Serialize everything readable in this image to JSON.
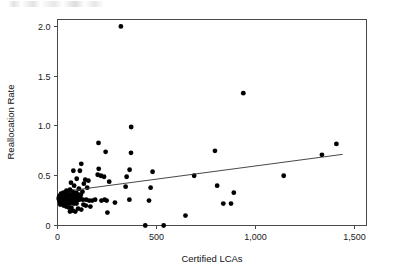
{
  "chart_data": {
    "type": "scatter",
    "title": "",
    "xlabel": "Certified LCAs",
    "ylabel": "Reallocation Rate",
    "xlim": [
      0,
      1560
    ],
    "ylim": [
      0,
      2.07
    ],
    "grid": false,
    "legend": null,
    "x_ticks": [
      0,
      500,
      1000,
      1500
    ],
    "x_tick_labels": [
      "0",
      "500",
      "1,000",
      "1,500"
    ],
    "y_ticks": [
      0,
      0.5,
      1.0,
      1.5,
      2.0
    ],
    "y_tick_labels": [
      "0",
      "0.5",
      "1.0",
      "1.5",
      "2.0"
    ],
    "marker": "filled-circle",
    "marker_color": "#000000",
    "points": [
      [
        320,
        2.0
      ],
      [
        938,
        1.33
      ],
      [
        372,
        0.99
      ],
      [
        207,
        0.83
      ],
      [
        1408,
        0.82
      ],
      [
        795,
        0.75
      ],
      [
        243,
        0.74
      ],
      [
        371,
        0.73
      ],
      [
        1335,
        0.71
      ],
      [
        120,
        0.62
      ],
      [
        208,
        0.57
      ],
      [
        364,
        0.56
      ],
      [
        480,
        0.54
      ],
      [
        80,
        0.55
      ],
      [
        113,
        0.55
      ],
      [
        203,
        0.51
      ],
      [
        219,
        0.5
      ],
      [
        235,
        0.49
      ],
      [
        349,
        0.49
      ],
      [
        690,
        0.5
      ],
      [
        1142,
        0.5
      ],
      [
        97,
        0.47
      ],
      [
        140,
        0.46
      ],
      [
        156,
        0.45
      ],
      [
        261,
        0.44
      ],
      [
        68,
        0.43
      ],
      [
        133,
        0.42
      ],
      [
        84,
        0.4
      ],
      [
        806,
        0.4
      ],
      [
        344,
        0.39
      ],
      [
        470,
        0.38
      ],
      [
        150,
        0.38
      ],
      [
        108,
        0.37
      ],
      [
        63,
        0.36
      ],
      [
        45,
        0.35
      ],
      [
        30,
        0.33
      ],
      [
        52,
        0.33
      ],
      [
        76,
        0.34
      ],
      [
        95,
        0.33
      ],
      [
        126,
        0.34
      ],
      [
        890,
        0.33
      ],
      [
        18,
        0.32
      ],
      [
        36,
        0.32
      ],
      [
        58,
        0.31
      ],
      [
        71,
        0.31
      ],
      [
        88,
        0.32
      ],
      [
        104,
        0.31
      ],
      [
        118,
        0.31
      ],
      [
        12,
        0.3
      ],
      [
        26,
        0.3
      ],
      [
        41,
        0.3
      ],
      [
        55,
        0.29
      ],
      [
        66,
        0.29
      ],
      [
        79,
        0.3
      ],
      [
        92,
        0.29
      ],
      [
        8,
        0.29
      ],
      [
        20,
        0.28
      ],
      [
        33,
        0.28
      ],
      [
        47,
        0.28
      ],
      [
        61,
        0.27
      ],
      [
        74,
        0.27
      ],
      [
        87,
        0.27
      ],
      [
        100,
        0.27
      ],
      [
        115,
        0.28
      ],
      [
        6,
        0.27
      ],
      [
        16,
        0.26
      ],
      [
        28,
        0.26
      ],
      [
        39,
        0.26
      ],
      [
        50,
        0.26
      ],
      [
        62,
        0.25
      ],
      [
        73,
        0.25
      ],
      [
        85,
        0.25
      ],
      [
        98,
        0.25
      ],
      [
        110,
        0.26
      ],
      [
        128,
        0.26
      ],
      [
        145,
        0.26
      ],
      [
        160,
        0.25
      ],
      [
        175,
        0.25
      ],
      [
        190,
        0.26
      ],
      [
        222,
        0.25
      ],
      [
        238,
        0.26
      ],
      [
        248,
        0.25
      ],
      [
        290,
        0.23
      ],
      [
        363,
        0.26
      ],
      [
        462,
        0.25
      ],
      [
        837,
        0.22
      ],
      [
        876,
        0.22
      ],
      [
        10,
        0.24
      ],
      [
        24,
        0.23
      ],
      [
        37,
        0.23
      ],
      [
        49,
        0.22
      ],
      [
        60,
        0.22
      ],
      [
        72,
        0.23
      ],
      [
        83,
        0.22
      ],
      [
        96,
        0.22
      ],
      [
        131,
        0.21
      ],
      [
        143,
        0.2
      ],
      [
        166,
        0.19
      ],
      [
        14,
        0.21
      ],
      [
        31,
        0.2
      ],
      [
        44,
        0.19
      ],
      [
        57,
        0.18
      ],
      [
        70,
        0.18
      ],
      [
        104,
        0.17
      ],
      [
        120,
        0.16
      ],
      [
        77,
        0.15
      ],
      [
        90,
        0.14
      ],
      [
        63,
        0.14
      ],
      [
        252,
        0.13
      ],
      [
        646,
        0.1
      ],
      [
        443,
        0.0
      ],
      [
        536,
        0.0
      ]
    ],
    "trend_line": {
      "x_start": 82,
      "y_start": 0.355,
      "x_end": 1440,
      "y_end": 0.715
    }
  }
}
